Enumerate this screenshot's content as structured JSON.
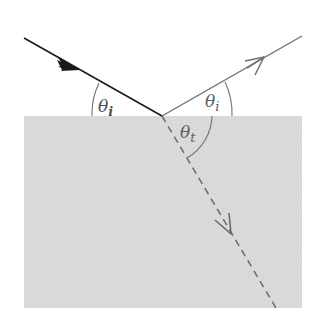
{
  "diagram": {
    "colors": {
      "background": "#ffffff",
      "medium_fill": "#dcdcdc",
      "incident_ray": "#1a1a1a",
      "reflected_ray": "#707070",
      "transmitted_ray": "#707070",
      "arc": "#707070",
      "label": "#505050"
    },
    "medium": {
      "x": 24,
      "y": 116,
      "width": 278,
      "height": 192
    },
    "vertex": {
      "x": 162,
      "y": 116
    },
    "rays": {
      "incident": {
        "x1": 24,
        "y1": 38,
        "x2": 162,
        "y2": 116,
        "style": "solid",
        "arrow": "filled"
      },
      "reflected": {
        "x1": 162,
        "y1": 116,
        "x2": 302,
        "y2": 36,
        "style": "solid",
        "arrow": "open"
      },
      "transmitted": {
        "x1": 162,
        "y1": 116,
        "x2": 276,
        "y2": 308,
        "style": "dashed",
        "arrow": "open"
      }
    },
    "labels": {
      "incident_angle": {
        "symbol": "θ",
        "subscript": "i"
      },
      "reflected_angle": {
        "symbol": "θ",
        "subscript": "i"
      },
      "transmitted_angle": {
        "symbol": "θ",
        "subscript": "t"
      }
    }
  }
}
